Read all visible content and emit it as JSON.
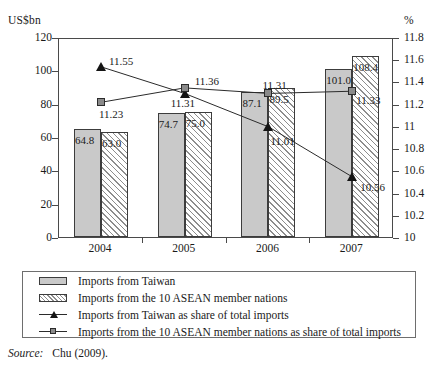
{
  "chart_data": {
    "type": "bar",
    "title": "",
    "subtitle": "",
    "xlabel": "",
    "ylabel": "US$bn",
    "y2label": "%",
    "categories": [
      "2004",
      "2005",
      "2006",
      "2007"
    ],
    "ylim": [
      0,
      120
    ],
    "y2lim": [
      10,
      11.8
    ],
    "yticks": [
      "120",
      "100",
      "80",
      "60",
      "40",
      "20",
      "0"
    ],
    "ytick_values": [
      120,
      100,
      80,
      60,
      40,
      20,
      0
    ],
    "y2ticks": [
      "11.8",
      "11.6",
      "11.4",
      "11.2",
      "11",
      "10.8",
      "10.6",
      "10.4",
      "10.2",
      "10"
    ],
    "y2tick_values": [
      11.8,
      11.6,
      11.4,
      11.2,
      11.0,
      10.8,
      10.6,
      10.4,
      10.2,
      10.0
    ],
    "grid": false,
    "legend_position": "below-plot",
    "series": [
      {
        "name": "Imports from Taiwan",
        "kind": "bar",
        "axis": "left",
        "style": "solid-gray",
        "values": [
          64.8,
          63.0,
          74.7,
          75.0
        ],
        "bar_values": [
          64.8,
          74.7,
          87.1,
          101.0
        ],
        "labels": [
          "64.8",
          "74.7",
          "87.1",
          "101.0"
        ]
      },
      {
        "name": "Imports from the 10 ASEAN member nations",
        "kind": "bar",
        "axis": "left",
        "style": "hatched",
        "bar_values": [
          63.0,
          75.0,
          89.5,
          108.4
        ],
        "labels": [
          "63.0",
          "75.0",
          "89.5",
          "108.4"
        ]
      },
      {
        "name": "Imports from Taiwan as share of total imports",
        "kind": "line",
        "axis": "right",
        "marker": "triangle",
        "values": [
          11.55,
          11.31,
          11.01,
          10.56
        ],
        "labels": [
          "11.55",
          "11.31",
          "11.01",
          "10.56"
        ]
      },
      {
        "name": "Imports from the 10 ASEAN member nations as share of total imports",
        "kind": "line",
        "axis": "right",
        "marker": "square",
        "values": [
          11.23,
          11.36,
          11.31,
          11.33
        ],
        "labels": [
          "11.23",
          "11.36",
          "11.31",
          "11.33"
        ]
      }
    ]
  },
  "axis": {
    "left_title": "US$bn",
    "right_title": "%"
  },
  "legend": {
    "entries": [
      {
        "label": "Imports from Taiwan",
        "key": "solid-swatch"
      },
      {
        "label": "Imports from the 10 ASEAN member nations",
        "key": "hatched-swatch"
      },
      {
        "label": "Imports from Taiwan as share of total imports",
        "key": "line-triangle"
      },
      {
        "label": "Imports from the 10 ASEAN member nations as share of total imports",
        "key": "line-square"
      }
    ]
  },
  "source": {
    "word": "Source:",
    "citation": "Chu (2009)."
  },
  "colors": {
    "bar_solid": "#c9c9c9",
    "hatch_stroke": "#8d8d8d",
    "bar_border": "#3c3c3c",
    "line": "#2b2b2b",
    "marker_square": "#8a8a8a",
    "marker_triangle": "#141414",
    "frame": "#4a4a4a",
    "text": "#1a1a1a"
  }
}
